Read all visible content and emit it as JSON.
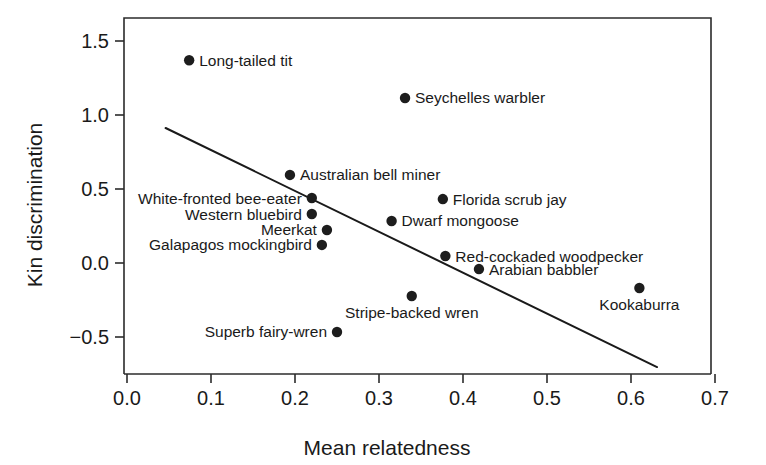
{
  "chart_data": {
    "type": "scatter",
    "title": "",
    "xlabel": "Mean relatedness",
    "ylabel": "Kin discrimination",
    "xlim": [
      0.0,
      0.7
    ],
    "ylim": [
      -0.7,
      1.62
    ],
    "grid": false,
    "legend": "none",
    "xticks": [
      "0.0",
      "0.1",
      "0.2",
      "0.3",
      "0.4",
      "0.5",
      "0.6",
      "0.7"
    ],
    "xtick_values": [
      0.0,
      0.1,
      0.2,
      0.3,
      0.4,
      0.5,
      0.6,
      0.7
    ],
    "yticks": [
      "1.5",
      "1.0",
      "0.5",
      "0.0",
      "−0.5"
    ],
    "ytick_values": [
      1.5,
      1.0,
      0.5,
      0.0,
      -0.5
    ],
    "points": [
      {
        "name": "Long-tailed tit",
        "x": 0.074,
        "y": 1.37,
        "label_side": "right"
      },
      {
        "name": "Seychelles warbler",
        "x": 0.331,
        "y": 1.115,
        "label_side": "right"
      },
      {
        "name": "Australian bell miner",
        "x": 0.194,
        "y": 0.595,
        "label_side": "right"
      },
      {
        "name": "White-fronted bee-eater",
        "x": 0.22,
        "y": 0.439,
        "label_side": "left"
      },
      {
        "name": "Western bluebird",
        "x": 0.22,
        "y": 0.331,
        "label_side": "left"
      },
      {
        "name": "Meerkat",
        "x": 0.238,
        "y": 0.223,
        "label_side": "left"
      },
      {
        "name": "Galapagos mockingbird",
        "x": 0.232,
        "y": 0.122,
        "label_side": "left"
      },
      {
        "name": "Florida scrub jay",
        "x": 0.376,
        "y": 0.432,
        "label_side": "right"
      },
      {
        "name": "Dwarf mongoose",
        "x": 0.315,
        "y": 0.284,
        "label_side": "right"
      },
      {
        "name": "Red-cockaded woodpecker",
        "x": 0.379,
        "y": 0.047,
        "label_side": "right"
      },
      {
        "name": "Arabian babbler",
        "x": 0.419,
        "y": -0.041,
        "label_side": "right"
      },
      {
        "name": "Stripe-backed wren",
        "x": 0.339,
        "y": -0.223,
        "label_side": "below"
      },
      {
        "name": "Superb fairy-wren",
        "x": 0.25,
        "y": -0.466,
        "label_side": "left"
      },
      {
        "name": "Kookaburra",
        "x": 0.61,
        "y": -0.169,
        "label_side": "below"
      }
    ],
    "trend_line": {
      "x_start": 0.046,
      "y_start": 0.912,
      "x_end": 0.631,
      "y_end": -0.703
    }
  }
}
